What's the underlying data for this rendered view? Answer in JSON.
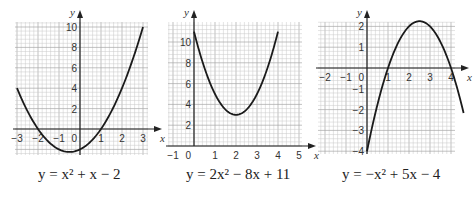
{
  "chart_data": [
    {
      "type": "line",
      "title": "",
      "caption": "y = x² + x − 2",
      "xlabel": "x",
      "ylabel": "y",
      "xlim": [
        -3,
        3
      ],
      "ylim": [
        -2.5,
        10.5
      ],
      "xticks": [
        -3,
        -2,
        -1,
        0,
        1,
        2,
        3
      ],
      "xtick_labels": [
        "−3",
        "−2",
        "−1",
        "0",
        "1",
        "2",
        "3"
      ],
      "yticks": [
        2,
        4,
        6,
        8,
        10
      ],
      "ytick_labels": [
        "2",
        "4",
        "6",
        "8",
        "10"
      ],
      "grid": true,
      "series": [
        {
          "name": "y = x² + x − 2",
          "coefficients": [
            1,
            1,
            -2
          ],
          "x_range": [
            -3,
            3
          ]
        }
      ]
    },
    {
      "type": "line",
      "title": "",
      "caption": "y = 2x² − 8x + 11",
      "xlabel": "x",
      "ylabel": "y",
      "xlim": [
        -1,
        5
      ],
      "ylim": [
        0,
        12
      ],
      "xticks": [
        -1,
        0,
        1,
        2,
        3,
        4,
        5
      ],
      "xtick_labels": [
        "−1",
        "0",
        "1",
        "2",
        "3",
        "4",
        "5"
      ],
      "yticks": [
        2,
        4,
        6,
        8,
        10
      ],
      "ytick_labels": [
        "2",
        "4",
        "6",
        "8",
        "10"
      ],
      "grid": true,
      "series": [
        {
          "name": "y = 2x² − 8x + 11",
          "coefficients": [
            2,
            -8,
            11
          ],
          "x_range": [
            0,
            4
          ]
        }
      ]
    },
    {
      "type": "line",
      "title": "",
      "caption": "y = −x² + 5x − 4",
      "xlabel": "x",
      "ylabel": "y",
      "xlim": [
        -2.3,
        4.3
      ],
      "ylim": [
        -4.1,
        2.3
      ],
      "xticks": [
        -2,
        -1,
        0,
        1,
        2,
        3,
        4
      ],
      "xtick_labels": [
        "−2",
        "−1",
        "0",
        "1",
        "2",
        "3",
        "4"
      ],
      "yticks": [
        -4,
        -3,
        -2,
        -1,
        1,
        2
      ],
      "ytick_labels": [
        "−4",
        "−3",
        "−2",
        "−1",
        "1",
        "2"
      ],
      "grid": true,
      "series": [
        {
          "name": "y = −x² + 5x − 4",
          "coefficients": [
            -1,
            5,
            -4
          ],
          "x_range": [
            0,
            4.6
          ]
        }
      ]
    }
  ]
}
